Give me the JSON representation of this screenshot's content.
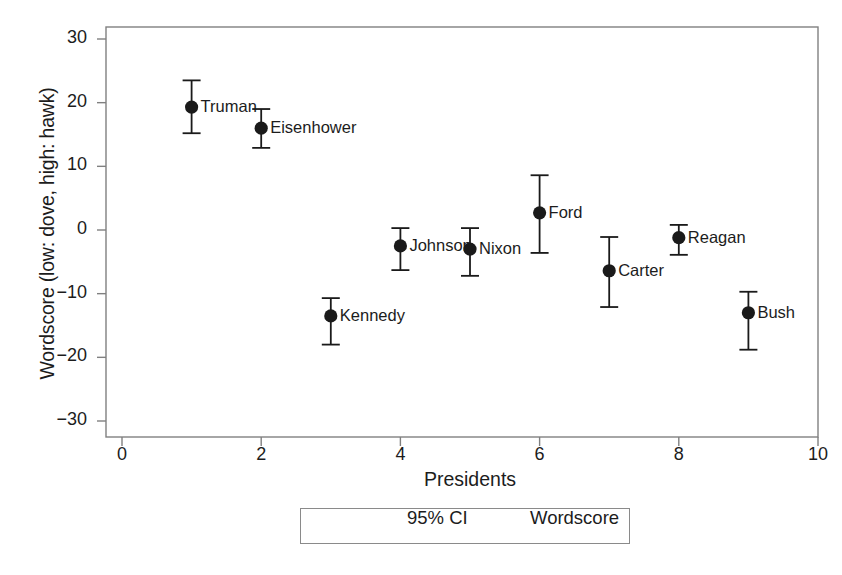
{
  "chart_data": {
    "type": "scatter",
    "title": "",
    "xlabel": "Presidents",
    "ylabel": "Wordscore (low: dove, high: hawk)",
    "xlim": [
      0,
      10
    ],
    "ylim": [
      -30,
      30
    ],
    "xticks": [
      "0",
      "2",
      "4",
      "6",
      "8",
      "10"
    ],
    "xtick_values": [
      0,
      2,
      4,
      6,
      8,
      10
    ],
    "yticks": [
      "30",
      "20",
      "10",
      "0",
      "−10",
      "−20",
      "−30"
    ],
    "ytick_values": [
      30,
      20,
      10,
      0,
      -10,
      -20,
      -30
    ],
    "grid": false,
    "legend_position": "below-axes",
    "error_bar_type": "95% CI",
    "point_marker": "filled-circle",
    "categories": [
      "Truman",
      "Eisenhower",
      "Kennedy",
      "Johnson",
      "Nixon",
      "Ford",
      "Carter",
      "Reagan",
      "Bush"
    ],
    "x": [
      1,
      2,
      3,
      4,
      5,
      6,
      7,
      8,
      9
    ],
    "values": [
      19.3,
      16.0,
      -13.5,
      -2.5,
      -3.0,
      2.7,
      -6.4,
      -1.2,
      -13.0
    ],
    "ci_low": [
      15.2,
      12.9,
      -18.0,
      -6.3,
      -7.2,
      -3.6,
      -12.1,
      -3.9,
      -18.8
    ],
    "ci_high": [
      23.5,
      19.0,
      -10.7,
      0.3,
      0.3,
      8.6,
      -1.1,
      0.8,
      -9.7
    ],
    "points": [
      {
        "label": "Truman",
        "x": 1,
        "y": 19.3,
        "ci_low": 15.2,
        "ci_high": 23.5
      },
      {
        "label": "Eisenhower",
        "x": 2,
        "y": 16.0,
        "ci_low": 12.9,
        "ci_high": 19.0
      },
      {
        "label": "Kennedy",
        "x": 3,
        "y": -13.5,
        "ci_low": -18.0,
        "ci_high": -10.7
      },
      {
        "label": "Johnson",
        "x": 4,
        "y": -2.5,
        "ci_low": -6.3,
        "ci_high": 0.3
      },
      {
        "label": "Nixon",
        "x": 5,
        "y": -3.0,
        "ci_low": -7.2,
        "ci_high": 0.3
      },
      {
        "label": "Ford",
        "x": 6,
        "y": 2.7,
        "ci_low": -3.6,
        "ci_high": 8.6
      },
      {
        "label": "Carter",
        "x": 7,
        "y": -6.4,
        "ci_low": -12.1,
        "ci_high": -1.1
      },
      {
        "label": "Reagan",
        "x": 8,
        "y": -1.2,
        "ci_low": -3.9,
        "ci_high": 0.8
      },
      {
        "label": "Bush",
        "x": 9,
        "y": -13.0,
        "ci_low": -18.8,
        "ci_high": -9.7
      }
    ],
    "legend": [
      {
        "key": "ci",
        "label": "95% CI",
        "marker": "horizontal-error-bar"
      },
      {
        "key": "wordscore",
        "label": "Wordscore",
        "marker": "filled-circle"
      }
    ],
    "colors": {
      "marker": "#1a1a1a",
      "error_bar": "#1a1a1a",
      "axis": "#808080",
      "background": "#ffffff",
      "text": "#1c1c1c"
    }
  }
}
